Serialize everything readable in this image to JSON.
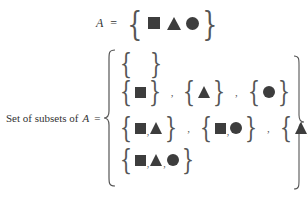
{
  "set_definition": {
    "symbol": "A",
    "equals": "=",
    "elements": [
      "square",
      "triangle",
      "circle"
    ]
  },
  "power_set": {
    "label_prefix": "Set of subsets of",
    "symbol": "A",
    "equals": "=",
    "rows": [
      [
        []
      ],
      [
        [
          "square"
        ],
        [
          "triangle"
        ],
        [
          "circle"
        ]
      ],
      [
        [
          "square",
          "triangle"
        ],
        [
          "square",
          "circle"
        ],
        [
          "triangle",
          "circle"
        ]
      ],
      [
        [
          "square",
          "triangle",
          "circle"
        ]
      ]
    ],
    "separator": ","
  },
  "colors": {
    "shape_fill": "#3d3d3d",
    "text": "#333333",
    "brace": "#555555"
  }
}
